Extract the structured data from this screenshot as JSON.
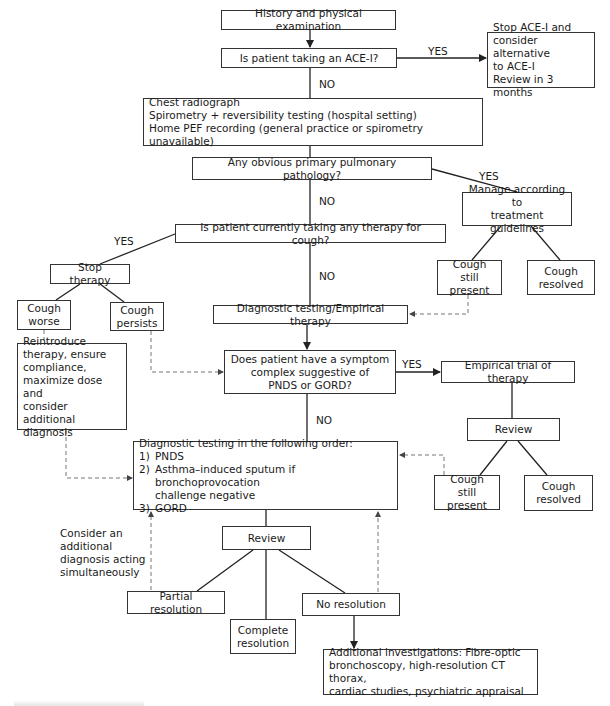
{
  "diagram": {
    "nodes": {
      "history": "History and physical examination",
      "ace_question": "Is patient taking an ACE-I?",
      "stop_ace": [
        "Stop ACE-I and",
        "consider alternative",
        "to ACE-I",
        "Review in 3 months"
      ],
      "investigations": [
        "Chest radiograph",
        "Spirometry + reversibility testing (hospital setting)",
        "Home PEF recording (general practice or spirometry unavailable)"
      ],
      "pulmonary_question": "Any obvious primary pulmonary pathology?",
      "manage_guidelines": [
        "Manage according to",
        "treatment guidelines"
      ],
      "cough_still_present_1": [
        "Cough still",
        "present"
      ],
      "cough_resolved_1": [
        "Cough",
        "resolved"
      ],
      "therapy_question": "Is patient currently taking any therapy for cough?",
      "stop_therapy": "Stop therapy",
      "cough_worse": [
        "Cough",
        "worse"
      ],
      "cough_persists": [
        "Cough",
        "persists"
      ],
      "diagnostic_empirical": "Diagnostic testing/Empirical therapy",
      "reintroduce": [
        "Reintroduce",
        "therapy, ensure",
        "compliance,",
        "maximize dose and",
        "consider additional",
        "diagnosis"
      ],
      "symptom_question": [
        "Does patient have a symptom",
        "complex suggestive of",
        "PNDS or GORD?"
      ],
      "empirical_trial": "Empirical trial of therapy",
      "review_1": "Review",
      "cough_still_present_2": [
        "Cough still",
        "present"
      ],
      "cough_resolved_2": [
        "Cough",
        "resolved"
      ],
      "diagnostic_order": {
        "title": "Diagnostic testing in the following order:",
        "items": [
          {
            "num": "1)",
            "text": "PNDS"
          },
          {
            "num": "2)",
            "text": "Asthma–induced sputum if bronchoprovocation"
          },
          {
            "num": "",
            "text": "challenge negative"
          },
          {
            "num": "3)",
            "text": "GORD"
          }
        ]
      },
      "review_2": "Review",
      "partial_resolution": "Partial resolution",
      "complete_resolution": [
        "Complete",
        "resolution"
      ],
      "no_resolution": "No resolution",
      "additional_investigations": [
        "Additional investigations: Fibre-optic",
        "bronchoscopy, high-resolution CT thorax,",
        "cardiac studies, psychiatric appraisal"
      ]
    },
    "edge_labels": {
      "ace_yes": "YES",
      "ace_no": "NO",
      "pulm_yes": "YES",
      "pulm_no": "NO",
      "therapy_yes": "YES",
      "therapy_no": "NO",
      "symptom_yes": "YES",
      "symptom_no": "NO"
    },
    "notes": {
      "consider_additional": [
        "Consider an",
        "additional",
        "diagnosis acting",
        "simultaneously"
      ]
    },
    "colors": {
      "line": "#222222",
      "box_border": "#333333",
      "dashed": "#777777"
    }
  }
}
